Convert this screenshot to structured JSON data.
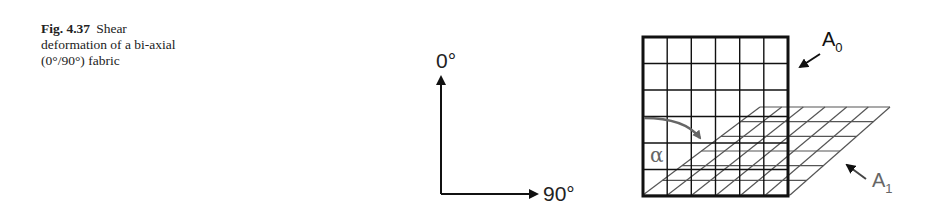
{
  "caption": {
    "label": "Fig. 4.37",
    "line1": "Shear",
    "line2": "deformation of a bi-axial",
    "line3": "(0°/90°) fabric"
  },
  "axes": {
    "vertical_label": "0°",
    "horizontal_label": "90°"
  },
  "diagram": {
    "original_grid_label": "A",
    "original_grid_subscript": "0",
    "sheared_grid_label": "A",
    "sheared_grid_subscript": "1",
    "shear_angle_symbol": "α",
    "grid_rows": 6,
    "grid_cols": 6,
    "colors": {
      "original_grid": "#111111",
      "sheared_grid": "#555555",
      "angle_arrow": "#666666"
    }
  }
}
